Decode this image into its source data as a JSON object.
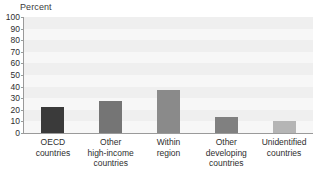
{
  "chart_data": {
    "type": "bar",
    "title": "Percent",
    "xlabel": "",
    "ylabel": "Percent",
    "ylim": [
      0,
      100
    ],
    "yticks": [
      0,
      10,
      20,
      30,
      40,
      50,
      60,
      70,
      80,
      90,
      100
    ],
    "ytick_labels": [
      "0",
      "10",
      "20",
      "30",
      "40",
      "50",
      "60",
      "70",
      "80",
      "90",
      "100"
    ],
    "grid": true,
    "legend": false,
    "categories": [
      "OECD countries",
      "Other high-income countries",
      "Within region",
      "Other developing countries",
      "Unidentified countries"
    ],
    "category_lines": [
      "OECD\ncountries",
      "Other\nhigh-income\ncountries",
      "Within\nregion",
      "Other\ndeveloping\ncountries",
      "Unidentified\ncountries"
    ],
    "values": [
      22,
      28,
      37,
      14,
      10
    ],
    "bar_colors": [
      "#3a3a3a",
      "#757575",
      "#8a8a8a",
      "#808080",
      "#b5b5b5"
    ]
  },
  "style": {
    "plot_background": "#f7f7f7",
    "band_color": "#efefef",
    "axis_color": "#9a9a9a",
    "text_color": "#2e2e2e",
    "title_color": "#3b3b3b"
  }
}
